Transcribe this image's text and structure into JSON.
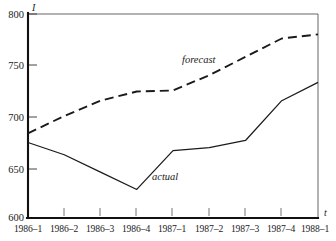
{
  "chart_data": {
    "type": "line",
    "title": "",
    "xlabel": "t",
    "ylabel": "I",
    "ylim": [
      600,
      800
    ],
    "yticks": [
      600,
      650,
      700,
      750,
      800
    ],
    "grid": false,
    "legend_position": "inline-annotation",
    "categories": [
      "1986-1",
      "1986-2",
      "1986-3",
      "1986-4",
      "1987-1",
      "1987-2",
      "1987-3",
      "1987-4",
      "1988-1"
    ],
    "tick_labels": [
      "1986–1",
      "1986–2",
      "1986–3",
      "1986–4",
      "1987–1",
      "1987–2",
      "1987–3",
      "1987–4",
      "1988–1"
    ],
    "series": [
      {
        "name": "actual",
        "style": "solid",
        "values": [
          674,
          662,
          645,
          628,
          666,
          669,
          676,
          715,
          733
        ]
      },
      {
        "name": "forecast",
        "style": "dashed",
        "values": [
          683,
          700,
          715,
          724,
          725,
          740,
          758,
          776,
          780
        ]
      }
    ],
    "annotations": [
      {
        "text": "forecast",
        "series": "forecast",
        "x": "1987-1",
        "y": 752
      },
      {
        "text": "actual",
        "series": "actual",
        "x": "1986-4",
        "y": 652
      }
    ]
  },
  "axis": {
    "y_label": "I",
    "x_label": "t",
    "y_tick_labels": [
      "800",
      "750",
      "700",
      "650",
      "600"
    ]
  }
}
